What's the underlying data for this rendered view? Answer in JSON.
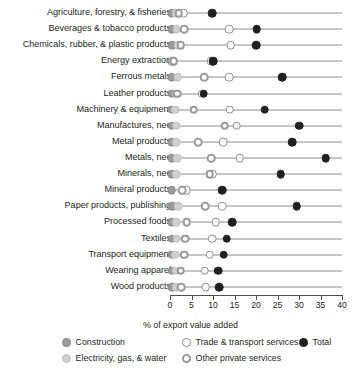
{
  "chart_data": {
    "type": "scatter",
    "title": "",
    "subtitle": "",
    "xlabel": "% of export value added",
    "ylabel": "",
    "xlim": [
      0,
      40
    ],
    "xticks": [
      0,
      5,
      10,
      15,
      20,
      25,
      30,
      35,
      40
    ],
    "xtick_labels": [
      "0",
      "5",
      "10",
      "15",
      "20",
      "25",
      "30",
      "35",
      "40"
    ],
    "grid": false,
    "legend_position": "bottom",
    "categories": [
      "Agriculture, forestry, & fisheries",
      "Beverages & tobacco products",
      "Chemicals, rubber, & plastic products",
      "Energy extraction",
      "Ferrous metals",
      "Leather products",
      "Machinery & equipment",
      "Manufactures, nec",
      "Metal products",
      "Metals, nec",
      "Minerals, nec",
      "Mineral products",
      "Paper products, publishing",
      "Processed foods",
      "Textiles",
      "Transport equipment",
      "Wearing apparel",
      "Wood products"
    ],
    "series": [
      {
        "name": "Construction",
        "key": "construction",
        "color": "#9b9b9b",
        "marker": "filled-circle",
        "values": [
          0.4,
          0.4,
          0.5,
          0.4,
          0.4,
          0.5,
          0.4,
          0.4,
          0.4,
          0.4,
          0.4,
          0.4,
          0.5,
          0.4,
          0.4,
          0.4,
          0.4,
          0.5
        ]
      },
      {
        "name": "Electricity, gas, & water",
        "key": "electricity",
        "color": "#cfcfcf",
        "marker": "filled-circle",
        "values": [
          1.3,
          1.6,
          1.9,
          0.8,
          1.8,
          1.5,
          1.2,
          1.4,
          1.5,
          1.7,
          1.4,
          3.1,
          1.9,
          1.5,
          1.6,
          1.2,
          1.3,
          1.4
        ]
      },
      {
        "name": "Trade & transport services",
        "key": "trade",
        "color": "#ffffff",
        "marker": "open-circle",
        "values": [
          3.2,
          13.8,
          14.1,
          9.6,
          13.8,
          7.5,
          13.9,
          15.5,
          12.4,
          16.2,
          9.9,
          3.8,
          12.1,
          10.6,
          9.8,
          9.2,
          8.1,
          8.3
        ]
      },
      {
        "name": "Other private services",
        "key": "other",
        "color": "#9b9b9b",
        "marker": "ring-circle",
        "values": [
          2.0,
          3.3,
          2.5,
          0.9,
          8.0,
          1.7,
          5.5,
          12.7,
          6.5,
          9.6,
          9.2,
          2.8,
          8.2,
          3.9,
          3.6,
          3.3,
          2.5,
          2.6
        ]
      },
      {
        "name": "Total",
        "key": "total",
        "color": "#231f20",
        "marker": "filled-circle",
        "values": [
          9.8,
          20.2,
          20.1,
          10.1,
          26.1,
          7.8,
          22.0,
          30.0,
          28.4,
          36.2,
          25.7,
          12.2,
          29.5,
          14.5,
          13.2,
          12.5,
          11.2,
          11.4
        ]
      }
    ]
  },
  "legend": {
    "items": [
      {
        "label": "Construction",
        "key": "construction"
      },
      {
        "label": "Trade & transport services",
        "key": "trade"
      },
      {
        "label": "Total",
        "key": "total"
      },
      {
        "label": "Electricity, gas, & water",
        "key": "electricity"
      },
      {
        "label": "Other private services",
        "key": "other"
      }
    ]
  }
}
